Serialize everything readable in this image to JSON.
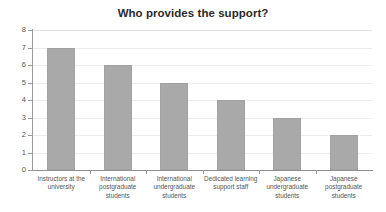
{
  "chart_data": {
    "type": "bar",
    "title": "Who provides the support?",
    "xlabel": "",
    "ylabel": "",
    "ylim": [
      0,
      8
    ],
    "ytick_step": 1,
    "yticks": [
      "8",
      "7",
      "6",
      "5",
      "4",
      "3",
      "2",
      "1",
      "0"
    ],
    "grid": true,
    "grid_axis": "y",
    "legend": false,
    "legend_position": "none",
    "orientation": "vertical",
    "categories": [
      "Instructors at the university",
      "International postgraduate students",
      "International undergraduate students",
      "Dedicated learning support staff",
      "Japanese undergraduate students",
      "Japanese postgraduate students"
    ],
    "values": [
      7,
      6,
      5,
      4,
      3,
      2
    ],
    "series": [
      {
        "name": "Who provides the support?",
        "values": [
          7,
          6,
          5,
          4,
          3,
          2
        ]
      }
    ],
    "bar_color": "#a9a9a9",
    "bar_border_color": "#a2a2a2",
    "gridline_color": "#ededed",
    "axis_color": "#9a9a9a",
    "title_color": "#2b2b2b",
    "tick_label_color": "#555555",
    "background_color": "#ffffff"
  }
}
